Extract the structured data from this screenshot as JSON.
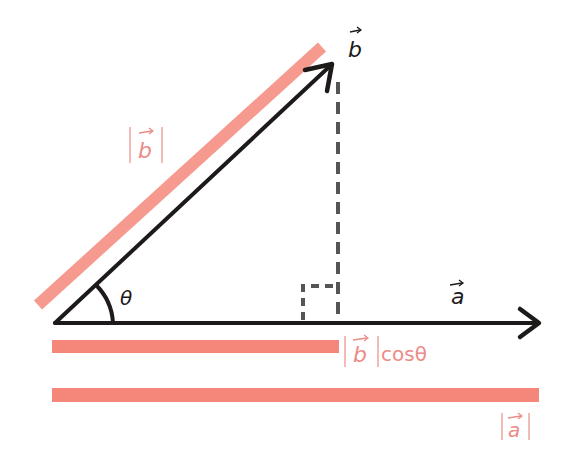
{
  "diagram": {
    "type": "vector-projection",
    "colors": {
      "vector": "#1e1a1a",
      "magnitude_bar": "#f5877a",
      "label_pink": "#ec8c86",
      "dashed": "#555555",
      "background": "#ffffff"
    },
    "labels": {
      "vector_b": "b",
      "vector_a": "a",
      "angle": "θ",
      "mag_b": "b",
      "proj": "b",
      "proj_suffix": "cosθ",
      "mag_a": "a"
    },
    "geometry": {
      "origin": [
        55,
        323
      ],
      "b_tip": [
        333,
        62
      ],
      "a_tip": [
        540,
        323
      ],
      "foot": [
        338,
        323
      ]
    }
  }
}
